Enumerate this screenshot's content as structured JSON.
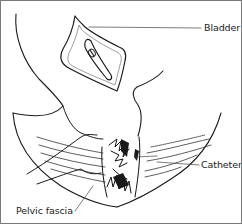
{
  "figure": {
    "type": "anatomical line drawing",
    "labels": [
      {
        "id": "bladder",
        "text": "Bladder"
      },
      {
        "id": "catheter",
        "text": "Catheter"
      },
      {
        "id": "pelvic_fascia",
        "text": "Pelvic fascia"
      }
    ],
    "colors": {
      "line": "#1a1a1a",
      "leader": "#444444",
      "frame": "#7a7a7a",
      "background": "#ffffff"
    }
  }
}
